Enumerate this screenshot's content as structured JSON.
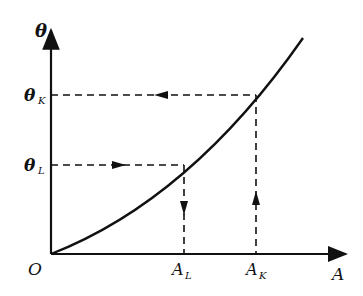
{
  "diagram": {
    "type": "curve-with-projections",
    "axes": {
      "y_label": "θ",
      "x_label": "A",
      "origin_label": "O"
    },
    "y_ticks": [
      {
        "main": "θ",
        "sub": "K"
      },
      {
        "main": "θ",
        "sub": "L"
      }
    ],
    "x_ticks": [
      {
        "main": "A",
        "sub": "L"
      },
      {
        "main": "A",
        "sub": "K"
      }
    ],
    "paths": [
      {
        "from": "θ_L",
        "to": "curve",
        "direction": "right",
        "then": "down to A_L"
      },
      {
        "from": "A_K",
        "to": "curve",
        "direction": "up",
        "then": "left to θ_K"
      }
    ],
    "colors": {
      "ink": "#111111",
      "background": "#ffffff"
    }
  }
}
